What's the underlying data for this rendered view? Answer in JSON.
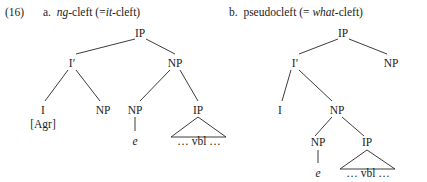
{
  "figure": {
    "example_number": "(16)",
    "items": [
      {
        "label": "a.",
        "title_plain_1": "-cleft (=",
        "title_italic_1": "ng",
        "title_italic_2": "it",
        "title_plain_2": "-cleft)",
        "title_full": "a.  ng-cleft (=it-cleft)"
      },
      {
        "label": "b.",
        "title_plain_1": "pseudocleft (= ",
        "title_italic_1": "what",
        "title_plain_2": "-cleft)",
        "title_full": "b.  pseudocleft (= what-cleft)"
      }
    ]
  },
  "tree_a": {
    "nodes": {
      "root_ip": "IP",
      "i_bar": "I′",
      "np_right": "NP",
      "i_head": "I",
      "agr": "[Agr]",
      "np_spec_of_ibar": "NP",
      "np_inner": "NP",
      "ip_inner": "IP",
      "empty_category": "e",
      "vbl": "… vbl …"
    }
  },
  "tree_b": {
    "nodes": {
      "root_ip": "IP",
      "i_bar": "I′",
      "np_right": "NP",
      "i_head": "I",
      "np_complement": "NP",
      "np_inner": "NP",
      "ip_inner": "IP",
      "empty_category": "e",
      "vbl": "… vbl …"
    }
  },
  "style": {
    "line_color": "#262626",
    "text_color": "#1b1b1b",
    "background": "#ffffff"
  }
}
